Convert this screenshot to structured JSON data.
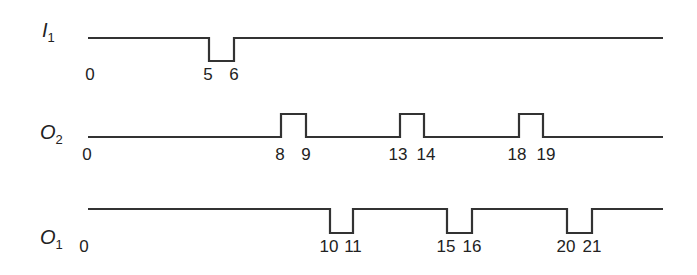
{
  "diagram": {
    "type": "timing-diagram",
    "x_start": 88,
    "x_end": 663,
    "t0_x": 90,
    "unit_px": 23.8,
    "signals": [
      {
        "id": "I1",
        "label_main": "I",
        "label_sub": "1",
        "idle": "high",
        "high_y": 38,
        "low_y": 61,
        "pulses": [
          [
            5,
            6
          ]
        ],
        "pulse_px": [
          [
            209,
            234
          ]
        ],
        "ticks": [
          {
            "text": "0",
            "x": 90,
            "y": 80
          },
          {
            "text": "5",
            "x": 208,
            "y": 80
          },
          {
            "text": "6",
            "x": 234,
            "y": 80
          }
        ]
      },
      {
        "id": "O2",
        "label_main": "O",
        "label_sub": "2",
        "idle": "low",
        "high_y": 114,
        "low_y": 137,
        "pulses": [
          [
            8,
            9
          ],
          [
            13,
            14
          ],
          [
            18,
            19
          ]
        ],
        "pulse_px": [
          [
            281,
            306
          ],
          [
            400,
            424
          ],
          [
            519,
            543
          ]
        ],
        "ticks": [
          {
            "text": "0",
            "x": 87,
            "y": 160
          },
          {
            "text": "8",
            "x": 280,
            "y": 160
          },
          {
            "text": "9",
            "x": 306,
            "y": 160
          },
          {
            "text": "13",
            "x": 398,
            "y": 160
          },
          {
            "text": "14",
            "x": 426,
            "y": 160
          },
          {
            "text": "18",
            "x": 517,
            "y": 160
          },
          {
            "text": "19",
            "x": 546,
            "y": 160
          }
        ]
      },
      {
        "id": "O1",
        "label_main": "O",
        "label_sub": "1",
        "idle": "high",
        "high_y": 209,
        "low_y": 233,
        "pulses": [
          [
            10,
            11
          ],
          [
            15,
            16
          ],
          [
            20,
            21
          ]
        ],
        "pulse_px": [
          [
            330,
            353
          ],
          [
            447,
            472
          ],
          [
            567,
            592
          ]
        ],
        "ticks": [
          {
            "text": "0",
            "x": 84,
            "y": 252
          },
          {
            "text": "10",
            "x": 329,
            "y": 252
          },
          {
            "text": "11",
            "x": 353,
            "y": 252
          },
          {
            "text": "15",
            "x": 446,
            "y": 252
          },
          {
            "text": "16",
            "x": 472,
            "y": 252
          },
          {
            "text": "20",
            "x": 566,
            "y": 252
          },
          {
            "text": "21",
            "x": 592,
            "y": 252
          }
        ]
      }
    ],
    "labels_pos": [
      {
        "x": 42,
        "y": 37
      },
      {
        "x": 40,
        "y": 139
      },
      {
        "x": 40,
        "y": 244
      }
    ]
  }
}
